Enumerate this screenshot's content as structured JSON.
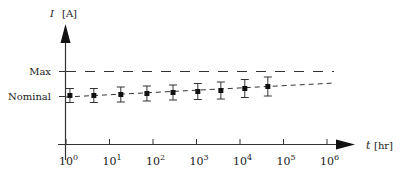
{
  "chart_data": {
    "type": "scatter",
    "title": "",
    "xlabel": "t [hr]",
    "ylabel": "I [A]",
    "x_scale": "log",
    "xlim_log10": [
      0,
      6
    ],
    "x_ticks": [
      "10^0",
      "10^1",
      "10^2",
      "10^3",
      "10^4",
      "10^5",
      "10^6"
    ],
    "x_tick_exponents": [
      0,
      1,
      2,
      3,
      4,
      5,
      6
    ],
    "y_ticks": [
      "Nominal",
      "Max"
    ],
    "y_tick_values": [
      1.0,
      2.0
    ],
    "grid": false,
    "legend": null,
    "series": [
      {
        "name": "Measured current",
        "style": "square markers with error bars",
        "x_log10": [
          0.09,
          0.64,
          1.26,
          1.86,
          2.46,
          3.03,
          3.56,
          4.11,
          4.64
        ],
        "y": [
          1.04,
          1.04,
          1.08,
          1.12,
          1.16,
          1.2,
          1.24,
          1.32,
          1.4
        ],
        "error_half_width": [
          0.28,
          0.28,
          0.3,
          0.3,
          0.3,
          0.32,
          0.34,
          0.36,
          0.38
        ]
      },
      {
        "name": "Trend (extrapolation)",
        "style": "short dashed line",
        "x_log10": [
          0.0,
          6.15
        ],
        "y": [
          0.96,
          1.52
        ]
      },
      {
        "name": "Max",
        "style": "long dashed horizontal line",
        "x_log10": [
          -0.1,
          6.15
        ],
        "y": [
          2.0,
          2.0
        ]
      }
    ]
  },
  "labels": {
    "y_axis_symbol": "I",
    "y_axis_unit": "[A]",
    "x_axis_symbol": "t",
    "x_axis_unit": "[hr]",
    "max_label": "Max",
    "nominal_label": "Nominal",
    "tick_base": "10",
    "tick_exps": [
      "0",
      "1",
      "2",
      "3",
      "4",
      "5",
      "6"
    ]
  }
}
